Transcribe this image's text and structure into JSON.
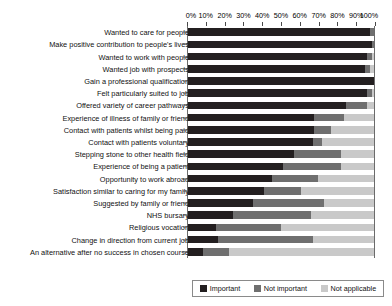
{
  "chart_data": {
    "type": "bar",
    "orientation": "horizontal",
    "stacked": true,
    "normalized_percent": true,
    "title": "",
    "subtitle": "",
    "xlabel": "",
    "ylabel": "",
    "xlim": [
      0,
      100
    ],
    "xtick_labels": [
      "0%",
      "10%",
      "20%",
      "30%",
      "40%",
      "50%",
      "60%",
      "70%",
      "80%",
      "90%",
      "100%"
    ],
    "xticks": [
      0,
      10,
      20,
      30,
      40,
      50,
      60,
      70,
      80,
      90,
      100
    ],
    "grid": false,
    "legend_position": "bottom",
    "legend": [
      "Important",
      "Not important",
      "Not applicable"
    ],
    "colors": {
      "important": "#231f20",
      "not_important": "#6f6f6f",
      "not_applicable": "#c9c9c9"
    },
    "categories": [
      "Wanted to care for people",
      "Make positive contribution to people's lives",
      "Wanted to work with people",
      "Wanted job with prospects",
      "Gain a professional qualification",
      "Felt particularly suited to job",
      "Offered variety of career pathways",
      "Experience of illness of family or friend",
      "Contact with patients whilst being paid",
      "Contact with patients voluntary",
      "Stepping stone to other health field",
      "Experience of being a patient",
      "Opportunity to work abroad",
      "Satisfaction similar to caring for my family",
      "Suggested by family or friend",
      "NHS bursary",
      "Religious vocation",
      "Change in direction from current job",
      "An alternative after no success in chosen course"
    ],
    "series": [
      {
        "name": "Important",
        "values": [
          98,
          99,
          96,
          95,
          100,
          96,
          85,
          68,
          68,
          67,
          57,
          51,
          45,
          41,
          35,
          24,
          15,
          16,
          8
        ]
      },
      {
        "name": "Not important",
        "values": [
          2,
          1,
          3,
          3,
          0,
          3,
          11,
          16,
          9,
          5,
          25,
          31,
          25,
          20,
          38,
          42,
          35,
          51,
          14
        ]
      },
      {
        "name": "Not applicable",
        "values": [
          0,
          0,
          1,
          2,
          0,
          1,
          4,
          16,
          23,
          28,
          18,
          18,
          30,
          39,
          27,
          34,
          50,
          33,
          78
        ]
      }
    ]
  }
}
